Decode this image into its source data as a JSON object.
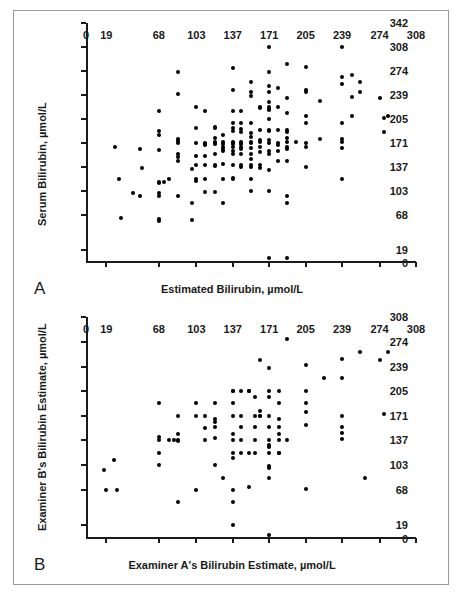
{
  "figure": {
    "background": "#ffffff",
    "border_color": "#9a9a9a",
    "marker_color": "#000000",
    "axis_color": "#1a1a1a"
  },
  "panels": [
    {
      "letter": "A",
      "xtitle": "Estimated Bilirubin, µmol/L",
      "ytitle": "Serum Bilirubin, µmol/L"
    },
    {
      "letter": "B",
      "xtitle": "Examiner A's Bilirubin Estimate, µmol/L",
      "ytitle": "Examiner B's Bilirubin Estimate, µmol/L"
    }
  ],
  "chart_data": [
    {
      "type": "scatter",
      "panel": "A",
      "title": "",
      "xlabel": "Estimated Bilirubin, µmol/L",
      "ylabel": "Serum Bilirubin, µmol/L",
      "xlim": [
        0,
        308
      ],
      "ylim": [
        0,
        342
      ],
      "xticks": [
        0,
        19,
        68,
        103,
        137,
        171,
        205,
        239,
        274,
        308
      ],
      "yticks": [
        0,
        19,
        68,
        103,
        137,
        171,
        205,
        239,
        274,
        308,
        342
      ],
      "grid": false,
      "legend": null,
      "points": [
        [
          44,
          100
        ],
        [
          27,
          165
        ],
        [
          31,
          120
        ],
        [
          33,
          64
        ],
        [
          50,
          163
        ],
        [
          50,
          96
        ],
        [
          52,
          135
        ],
        [
          68,
          216
        ],
        [
          68,
          188
        ],
        [
          68,
          182
        ],
        [
          68,
          161
        ],
        [
          68,
          116
        ],
        [
          68,
          114
        ],
        [
          68,
          100
        ],
        [
          68,
          95
        ],
        [
          68,
          63
        ],
        [
          68,
          60
        ],
        [
          73,
          116
        ],
        [
          77,
          120
        ],
        [
          86,
          272
        ],
        [
          86,
          241
        ],
        [
          86,
          177
        ],
        [
          86,
          174
        ],
        [
          86,
          171
        ],
        [
          86,
          155
        ],
        [
          86,
          151
        ],
        [
          86,
          146
        ],
        [
          86,
          96
        ],
        [
          99,
          134
        ],
        [
          99,
          85
        ],
        [
          99,
          61
        ],
        [
          103,
          222
        ],
        [
          103,
          192
        ],
        [
          103,
          171
        ],
        [
          103,
          152
        ],
        [
          103,
          139
        ],
        [
          103,
          119
        ],
        [
          103,
          117
        ],
        [
          111,
          216
        ],
        [
          111,
          171
        ],
        [
          111,
          170
        ],
        [
          111,
          168
        ],
        [
          111,
          153
        ],
        [
          111,
          140
        ],
        [
          111,
          120
        ],
        [
          111,
          101
        ],
        [
          120,
          194
        ],
        [
          120,
          192
        ],
        [
          120,
          178
        ],
        [
          120,
          172
        ],
        [
          120,
          171
        ],
        [
          120,
          170
        ],
        [
          120,
          155
        ],
        [
          120,
          140
        ],
        [
          120,
          138
        ],
        [
          120,
          101
        ],
        [
          128,
          183
        ],
        [
          128,
          172
        ],
        [
          128,
          170
        ],
        [
          128,
          166
        ],
        [
          128,
          163
        ],
        [
          128,
          160
        ],
        [
          128,
          141
        ],
        [
          128,
          120
        ],
        [
          128,
          85
        ],
        [
          137,
          278
        ],
        [
          137,
          246
        ],
        [
          137,
          217
        ],
        [
          137,
          200
        ],
        [
          137,
          193
        ],
        [
          137,
          188
        ],
        [
          137,
          172
        ],
        [
          137,
          171
        ],
        [
          137,
          170
        ],
        [
          137,
          166
        ],
        [
          137,
          160
        ],
        [
          137,
          155
        ],
        [
          137,
          140
        ],
        [
          137,
          121
        ],
        [
          137,
          119
        ],
        [
          145,
          216
        ],
        [
          145,
          200
        ],
        [
          145,
          191
        ],
        [
          145,
          186
        ],
        [
          145,
          172
        ],
        [
          145,
          171
        ],
        [
          145,
          170
        ],
        [
          145,
          166
        ],
        [
          145,
          162
        ],
        [
          145,
          155
        ],
        [
          145,
          140
        ],
        [
          145,
          137
        ],
        [
          154,
          258
        ],
        [
          154,
          243
        ],
        [
          154,
          238
        ],
        [
          154,
          200
        ],
        [
          154,
          185
        ],
        [
          154,
          180
        ],
        [
          154,
          172
        ],
        [
          154,
          171
        ],
        [
          154,
          164
        ],
        [
          154,
          155
        ],
        [
          154,
          148
        ],
        [
          154,
          140
        ],
        [
          154,
          137
        ],
        [
          154,
          120
        ],
        [
          154,
          102
        ],
        [
          162,
          223
        ],
        [
          162,
          221
        ],
        [
          162,
          190
        ],
        [
          162,
          175
        ],
        [
          162,
          172
        ],
        [
          162,
          166
        ],
        [
          162,
          158
        ],
        [
          162,
          140
        ],
        [
          162,
          136
        ],
        [
          171,
          308
        ],
        [
          171,
          272
        ],
        [
          171,
          252
        ],
        [
          171,
          244
        ],
        [
          171,
          230
        ],
        [
          171,
          223
        ],
        [
          171,
          220
        ],
        [
          171,
          218
        ],
        [
          171,
          205
        ],
        [
          171,
          190
        ],
        [
          171,
          188
        ],
        [
          171,
          175
        ],
        [
          171,
          171
        ],
        [
          171,
          160
        ],
        [
          171,
          155
        ],
        [
          171,
          133
        ],
        [
          171,
          102
        ],
        [
          171,
          7
        ],
        [
          179,
          250
        ],
        [
          179,
          222
        ],
        [
          179,
          190
        ],
        [
          179,
          171
        ],
        [
          179,
          168
        ],
        [
          179,
          160
        ],
        [
          179,
          145
        ],
        [
          188,
          284
        ],
        [
          188,
          235
        ],
        [
          188,
          214
        ],
        [
          188,
          190
        ],
        [
          188,
          186
        ],
        [
          188,
          178
        ],
        [
          188,
          172
        ],
        [
          188,
          166
        ],
        [
          188,
          163
        ],
        [
          188,
          145
        ],
        [
          188,
          95
        ],
        [
          188,
          85
        ],
        [
          188,
          7
        ],
        [
          196,
          172
        ],
        [
          205,
          280
        ],
        [
          205,
          243
        ],
        [
          205,
          246
        ],
        [
          205,
          209
        ],
        [
          205,
          200
        ],
        [
          205,
          171
        ],
        [
          205,
          166
        ],
        [
          205,
          137
        ],
        [
          218,
          231
        ],
        [
          218,
          176
        ],
        [
          239,
          308
        ],
        [
          239,
          265
        ],
        [
          239,
          255
        ],
        [
          239,
          200
        ],
        [
          239,
          176
        ],
        [
          239,
          172
        ],
        [
          239,
          164
        ],
        [
          239,
          120
        ],
        [
          248,
          268
        ],
        [
          248,
          236
        ],
        [
          248,
          209
        ],
        [
          256,
          258
        ],
        [
          256,
          244
        ],
        [
          274,
          235
        ],
        [
          278,
          207
        ],
        [
          278,
          187
        ],
        [
          282,
          209
        ]
      ]
    },
    {
      "type": "scatter",
      "panel": "B",
      "title": "",
      "xlabel": "Examiner A's Bilirubin Estimate, µmol/L",
      "ylabel": "Examiner B's Bilirubin Estimate, µmol/L",
      "xlim": [
        0,
        308
      ],
      "ylim": [
        0,
        308
      ],
      "xticks": [
        0,
        19,
        68,
        103,
        137,
        171,
        205,
        239,
        274,
        308
      ],
      "yticks": [
        0,
        19,
        68,
        103,
        137,
        171,
        205,
        239,
        274,
        308
      ],
      "grid": false,
      "legend": null,
      "points": [
        [
          17,
          96
        ],
        [
          19,
          68
        ],
        [
          26,
          110
        ],
        [
          29,
          68
        ],
        [
          68,
          188
        ],
        [
          68,
          141
        ],
        [
          68,
          137
        ],
        [
          68,
          120
        ],
        [
          68,
          103
        ],
        [
          77,
          137
        ],
        [
          82,
          137
        ],
        [
          86,
          171
        ],
        [
          86,
          146
        ],
        [
          86,
          137
        ],
        [
          86,
          136
        ],
        [
          86,
          51
        ],
        [
          103,
          188
        ],
        [
          103,
          171
        ],
        [
          103,
          68
        ],
        [
          111,
          171
        ],
        [
          111,
          154
        ],
        [
          111,
          137
        ],
        [
          120,
          188
        ],
        [
          120,
          166
        ],
        [
          120,
          162
        ],
        [
          120,
          155
        ],
        [
          120,
          140
        ],
        [
          120,
          103
        ],
        [
          128,
          85
        ],
        [
          137,
          206
        ],
        [
          137,
          205
        ],
        [
          137,
          188
        ],
        [
          137,
          171
        ],
        [
          137,
          146
        ],
        [
          137,
          137
        ],
        [
          137,
          120
        ],
        [
          137,
          112
        ],
        [
          137,
          68
        ],
        [
          137,
          51
        ],
        [
          137,
          20
        ],
        [
          145,
          205
        ],
        [
          145,
          171
        ],
        [
          145,
          155
        ],
        [
          145,
          137
        ],
        [
          145,
          120
        ],
        [
          152,
          205
        ],
        [
          152,
          205
        ],
        [
          152,
          120
        ],
        [
          152,
          72
        ],
        [
          158,
          197
        ],
        [
          158,
          171
        ],
        [
          158,
          155
        ],
        [
          158,
          137
        ],
        [
          158,
          120
        ],
        [
          162,
          248
        ],
        [
          162,
          178
        ],
        [
          162,
          171
        ],
        [
          162,
          171
        ],
        [
          171,
          237
        ],
        [
          171,
          205
        ],
        [
          171,
          197
        ],
        [
          171,
          171
        ],
        [
          171,
          155
        ],
        [
          171,
          137
        ],
        [
          171,
          131
        ],
        [
          171,
          128
        ],
        [
          171,
          120
        ],
        [
          171,
          101
        ],
        [
          171,
          99
        ],
        [
          171,
          85
        ],
        [
          171,
          6
        ],
        [
          180,
          205
        ],
        [
          180,
          188
        ],
        [
          180,
          166
        ],
        [
          180,
          155
        ],
        [
          180,
          145
        ],
        [
          180,
          137
        ],
        [
          180,
          120
        ],
        [
          180,
          119
        ],
        [
          188,
          277
        ],
        [
          188,
          137
        ],
        [
          205,
          241
        ],
        [
          205,
          206
        ],
        [
          205,
          188
        ],
        [
          205,
          176
        ],
        [
          205,
          158
        ],
        [
          205,
          70
        ],
        [
          222,
          223
        ],
        [
          239,
          250
        ],
        [
          239,
          223
        ],
        [
          239,
          171
        ],
        [
          239,
          155
        ],
        [
          239,
          147
        ],
        [
          239,
          139
        ],
        [
          256,
          260
        ],
        [
          260,
          85
        ],
        [
          274,
          248
        ],
        [
          278,
          173
        ],
        [
          282,
          260
        ]
      ]
    }
  ]
}
